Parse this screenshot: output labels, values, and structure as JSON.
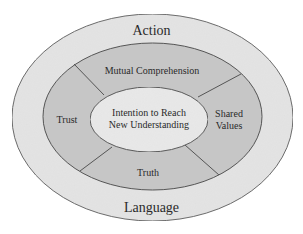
{
  "diagram": {
    "type": "concentric-ellipses",
    "colors": {
      "background": "#ffffff",
      "outer_ring": "#e4e4e4",
      "middle_ring": "#c6c6c6",
      "inner_core": "#e9e9e9",
      "outline": "#555555",
      "text": "#2a2a2a"
    },
    "outer_ring": {
      "top_label": "Action",
      "bottom_label": "Language"
    },
    "middle_ring": {
      "segments": [
        {
          "position": "top",
          "label": "Mutual Comprehension"
        },
        {
          "position": "right",
          "label_line1": "Shared",
          "label_line2": "Values"
        },
        {
          "position": "bottom",
          "label": "Truth"
        },
        {
          "position": "left",
          "label": "Trust"
        }
      ]
    },
    "inner_core": {
      "label_line1": "Intention to Reach",
      "label_line2": "New Understanding"
    }
  }
}
